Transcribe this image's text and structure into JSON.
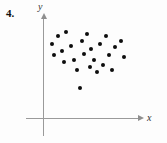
{
  "figure": {
    "problem_number": "4.",
    "background_color": "#fdfdfd",
    "point_color": "#0d0d0d",
    "axis_color": "#9a9a9a"
  },
  "axes": {
    "x_label": "x",
    "y_label": "y",
    "x_axis_pixel_y": 118,
    "y_axis_pixel_x": 43,
    "x_arrow": "arrow-right",
    "y_arrow": "arrow-up"
  },
  "chart_data": {
    "type": "scatter",
    "title": "4.",
    "xlabel": "x",
    "ylabel": "y",
    "grid": false,
    "legend": null,
    "axis_ticks": [],
    "xlim": [
      0,
      100
    ],
    "ylim": [
      0,
      100
    ],
    "n_points": 25,
    "points_pixels": [
      [
        52,
        44
      ],
      [
        54,
        55
      ],
      [
        58,
        36
      ],
      [
        62,
        51
      ],
      [
        64,
        62
      ],
      [
        66,
        32
      ],
      [
        71,
        46
      ],
      [
        74,
        60
      ],
      [
        77,
        70
      ],
      [
        82,
        41
      ],
      [
        84,
        54
      ],
      [
        87,
        34
      ],
      [
        90,
        67
      ],
      [
        91,
        49
      ],
      [
        94,
        60
      ],
      [
        97,
        72
      ],
      [
        100,
        44
      ],
      [
        103,
        65
      ],
      [
        106,
        36
      ],
      [
        109,
        55
      ],
      [
        112,
        70
      ],
      [
        115,
        47
      ],
      [
        121,
        41
      ],
      [
        124,
        57
      ],
      [
        80,
        88
      ]
    ],
    "x": [
      8,
      11,
      15,
      19,
      21,
      23,
      28,
      31,
      34,
      39,
      41,
      44,
      47,
      48,
      51,
      54,
      57,
      60,
      63,
      66,
      69,
      72,
      78,
      81,
      37
    ],
    "y": [
      74,
      63,
      82,
      67,
      56,
      86,
      72,
      58,
      48,
      77,
      64,
      84,
      51,
      69,
      58,
      46,
      74,
      53,
      82,
      63,
      48,
      71,
      77,
      61,
      30
    ]
  }
}
